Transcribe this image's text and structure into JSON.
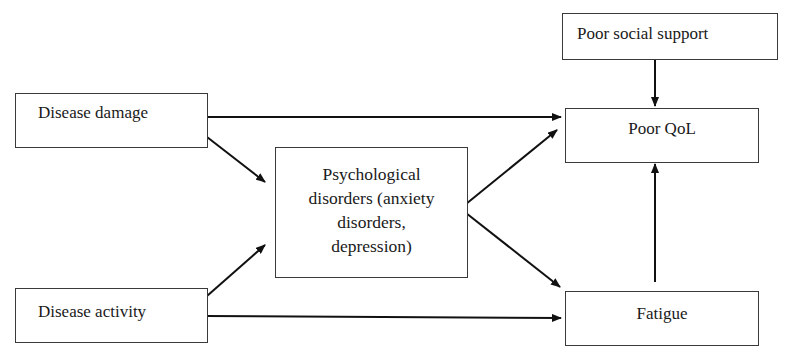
{
  "diagram": {
    "nodes": [
      {
        "id": "disease_damage",
        "label": "Disease damage"
      },
      {
        "id": "disease_activity",
        "label": "Disease activity"
      },
      {
        "id": "psychological_disorders",
        "lines": [
          "Psychological",
          "disorders (anxiety",
          "disorders,",
          "depression)"
        ]
      },
      {
        "id": "poor_social_support",
        "label": "Poor social support"
      },
      {
        "id": "poor_qol",
        "label": "Poor QoL"
      },
      {
        "id": "fatigue",
        "label": "Fatigue"
      }
    ],
    "edges": [
      {
        "from": "disease_damage",
        "to": "poor_qol"
      },
      {
        "from": "disease_damage",
        "to": "psychological_disorders"
      },
      {
        "from": "disease_activity",
        "to": "psychological_disorders"
      },
      {
        "from": "disease_activity",
        "to": "fatigue"
      },
      {
        "from": "psychological_disorders",
        "to": "poor_qol"
      },
      {
        "from": "psychological_disorders",
        "to": "fatigue"
      },
      {
        "from": "poor_social_support",
        "to": "poor_qol"
      },
      {
        "from": "fatigue",
        "to": "poor_qol"
      }
    ]
  }
}
